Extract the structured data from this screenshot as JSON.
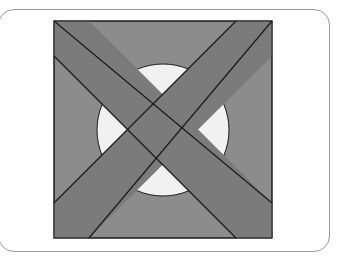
{
  "figure": {
    "colors": {
      "square_fill": "#8c8c8c",
      "band_fill": "#7b7b7b",
      "circle_fill": "#f1f1f1",
      "stroke": "#1a1a1a",
      "card_border": "#9a9a9a"
    },
    "square": {
      "x": 54,
      "y": 21,
      "width": 218,
      "height": 217
    },
    "circle": {
      "cx": 163,
      "cy": 130,
      "r": 66
    },
    "band_backslash": {
      "points": "54,21 54,56 236,238 272,238 272,203 89,21"
    },
    "band_slash": {
      "points": "236,21 272,21 272,56 89,238 54,238 54,203"
    }
  }
}
